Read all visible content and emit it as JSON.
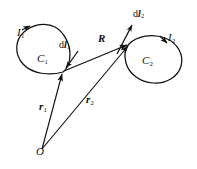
{
  "figure": {
    "kind": "physics-vector-diagram",
    "stroke_color": "#101010",
    "background_color": "#ffffff",
    "width": 197,
    "height": 169
  },
  "labels": {
    "current_left": {
      "symbol": "I",
      "subscript": "1",
      "x": 17,
      "y": 27
    },
    "current_right": {
      "symbol": "I",
      "subscript": "2",
      "x": 168,
      "y": 32
    },
    "curve_left": {
      "symbol": "C",
      "subscript": "1",
      "x": 37,
      "y": 53
    },
    "curve_right": {
      "symbol": "C",
      "subscript": "2",
      "x": 142,
      "y": 55
    },
    "element_left": {
      "prefix": "d",
      "symbol": "l",
      "subscript": "1",
      "x": 59,
      "y": 40
    },
    "element_right": {
      "prefix": "d",
      "symbol": "l",
      "subscript": "2",
      "x": 133,
      "y": 9
    },
    "separation_vector": {
      "symbol": "R",
      "subscript": "",
      "x": 98,
      "y": 33
    },
    "position_left": {
      "symbol": "r",
      "subscript": "1",
      "x": 39,
      "y": 101
    },
    "position_right": {
      "symbol": "r",
      "subscript": "2",
      "x": 86,
      "y": 94
    },
    "origin": {
      "symbol": "O",
      "subscript": "",
      "x": 36,
      "y": 146
    }
  },
  "geometry": {
    "origin_point": [
      42,
      149
    ],
    "left_loop_node": [
      63,
      72
    ],
    "right_loop_node": [
      129,
      44
    ],
    "left_loop_center": [
      47,
      56
    ],
    "right_loop_center": [
      152,
      62
    ],
    "vectors": [
      {
        "name": "r1",
        "from": [
          42,
          149
        ],
        "to": [
          63,
          72
        ]
      },
      {
        "name": "r2",
        "from": [
          42,
          149
        ],
        "to": [
          129,
          44
        ]
      },
      {
        "name": "R",
        "from": [
          63,
          72
        ],
        "to": [
          129,
          44
        ]
      },
      {
        "name": "dl1",
        "from": [
          76,
          53
        ],
        "to": [
          64,
          70
        ]
      },
      {
        "name": "dl2",
        "from": [
          118,
          52
        ],
        "to": [
          133,
          23
        ]
      }
    ]
  }
}
